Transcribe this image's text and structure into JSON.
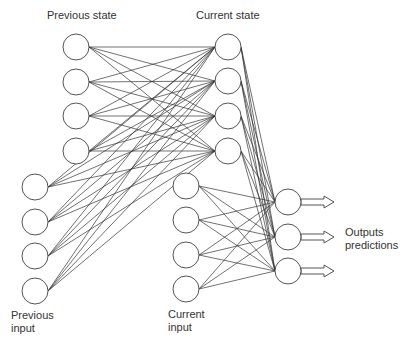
{
  "diagram": {
    "labels": {
      "previous_state": "Previous state",
      "current_state": "Current state",
      "previous_input_line1": "Previous",
      "previous_input_line2": "input",
      "current_input_line1": "Current",
      "current_input_line2": "input",
      "outputs_line1": "Outputs",
      "outputs_line2": "predictions"
    },
    "node_radius": 13,
    "layers": {
      "previous_state": {
        "x": 76,
        "y": [
          47,
          82,
          116,
          151
        ]
      },
      "previous_input": {
        "x": 35,
        "y": [
          187,
          222,
          256,
          291
        ]
      },
      "current_state": {
        "x": 228,
        "y": [
          47,
          81,
          116,
          151
        ]
      },
      "current_input": {
        "x": 186,
        "y": [
          186,
          220,
          255,
          289
        ]
      },
      "outputs": {
        "x": 288,
        "y": [
          202,
          237,
          271
        ]
      }
    },
    "connections": [
      {
        "from": "previous_state",
        "to": "current_state",
        "type": "fully-connected"
      },
      {
        "from": "previous_input",
        "to": "current_state",
        "type": "fully-connected"
      },
      {
        "from": "current_state",
        "to": "outputs",
        "type": "fully-connected"
      },
      {
        "from": "current_input",
        "to": "outputs",
        "type": "fully-connected"
      }
    ],
    "output_arrows": {
      "count": 3,
      "x_start": 301,
      "x_end": 334
    },
    "colors": {
      "stroke": "#555555",
      "edge": "#333333",
      "text": "#333333",
      "background": "#ffffff"
    }
  }
}
